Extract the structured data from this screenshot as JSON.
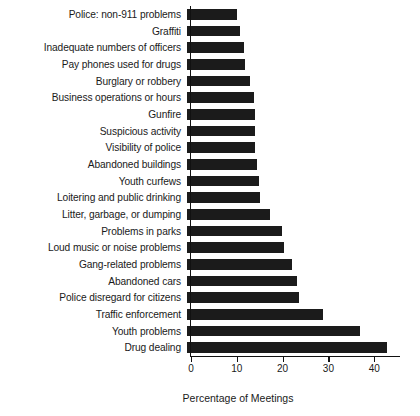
{
  "chart_data": {
    "type": "bar",
    "orientation": "horizontal",
    "title": "",
    "xlabel": "Percentage of Meetings",
    "ylabel": "",
    "xlim": [
      0,
      46
    ],
    "xticks": [
      0,
      10,
      20,
      30,
      40
    ],
    "xtick_labels": [
      "0",
      "10",
      "20",
      "30",
      "40"
    ],
    "grid": false,
    "legend": null,
    "bar_color": "#1b1b1b",
    "axis_color": "#111111",
    "categories": [
      "Police: non-911 problems",
      "Graffiti",
      "Inadequate numbers of officers",
      "Pay phones used for drugs",
      "Burglary or robbery",
      "Business operations or hours",
      "Gunfire",
      "Suspicious activity",
      "Visibility of police",
      "Abandoned buildings",
      "Youth curfews",
      "Loitering and public drinking",
      "Litter, garbage, or dumping",
      "Problems in parks",
      "Loud music or noise problems",
      "Gang-related problems",
      "Abandoned cars",
      "Police disregard for citizens",
      "Traffic enforcement",
      "Youth problems",
      "Drug dealing"
    ],
    "values": [
      11.0,
      11.6,
      12.4,
      12.7,
      13.8,
      14.6,
      14.9,
      14.9,
      14.9,
      15.3,
      15.7,
      16.0,
      18.2,
      20.7,
      21.1,
      22.9,
      24.0,
      24.4,
      29.8,
      37.8,
      43.7
    ]
  }
}
